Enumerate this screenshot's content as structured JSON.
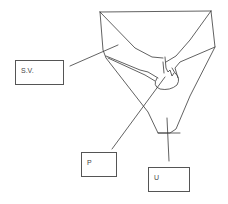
{
  "diagram": {
    "type": "hand-drawn anatomical sketch",
    "labels": [
      {
        "id": "sv",
        "text": "S.V."
      },
      {
        "id": "p",
        "text": "P"
      },
      {
        "id": "u",
        "text": "U"
      }
    ],
    "stroke_color": "#3a3a3a"
  }
}
